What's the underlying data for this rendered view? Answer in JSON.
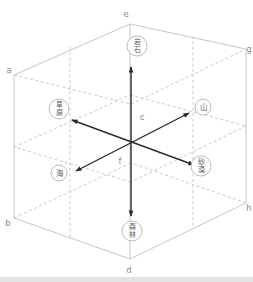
{
  "figure": {
    "width": 253,
    "height": 282,
    "colors": {
      "background": "#ffffff",
      "cube_line": "#c6c6c6",
      "dashed_line": "#c9c9c9",
      "arrow": "#2b2b2b",
      "vertex_label": "#8a8a8a",
      "node_ring": "#b4b4b4",
      "node_fill": "#ffffff",
      "node_text": "#5a5a5a",
      "bottom_strip": "#e3e3e3"
    },
    "solid_lines": [
      [
        14,
        75,
        130,
        24
      ],
      [
        130,
        24,
        246,
        49
      ],
      [
        246,
        49,
        246,
        203
      ],
      [
        246,
        203,
        130,
        259
      ],
      [
        130,
        259,
        14,
        218
      ],
      [
        14,
        218,
        14,
        75
      ],
      [
        130,
        24,
        130,
        259
      ]
    ],
    "dashed_lines": [
      [
        14,
        75,
        131,
        104
      ],
      [
        131,
        104,
        246,
        49
      ],
      [
        14,
        218,
        131,
        163
      ],
      [
        246,
        203,
        131,
        163
      ],
      [
        14,
        147,
        130,
        95
      ],
      [
        130,
        95,
        246,
        126
      ],
      [
        246,
        126,
        131,
        182
      ],
      [
        131,
        182,
        14,
        147
      ],
      [
        70,
        47,
        70,
        240
      ],
      [
        193,
        36,
        193,
        227
      ]
    ],
    "arrows": [
      {
        "name": "axis-vertical",
        "x1": 131,
        "y1": 67,
        "x2": 131,
        "y2": 216
      },
      {
        "name": "axis-ne-sw",
        "x1": 189,
        "y1": 113,
        "x2": 76,
        "y2": 171
      },
      {
        "name": "axis-nw-se",
        "x1": 72,
        "y1": 120,
        "x2": 194,
        "y2": 165
      }
    ],
    "vertex_labels": [
      {
        "id": "e",
        "text": "e",
        "x": 126,
        "y": 17
      },
      {
        "id": "a",
        "text": "a",
        "x": 9,
        "y": 73
      },
      {
        "id": "g",
        "text": "g",
        "x": 249,
        "y": 52
      },
      {
        "id": "b",
        "text": "b",
        "x": 8,
        "y": 226
      },
      {
        "id": "h",
        "text": "h",
        "x": 249,
        "y": 211
      },
      {
        "id": "d",
        "text": "d",
        "x": 129,
        "y": 273
      },
      {
        "id": "c",
        "text": "c",
        "x": 142,
        "y": 120
      },
      {
        "id": "f",
        "text": "f",
        "x": 120,
        "y": 164
      }
    ],
    "word_nodes": [
      {
        "id": "top",
        "text": "岩石",
        "x": 137,
        "y": 46,
        "r": 10
      },
      {
        "id": "left-upper",
        "text": "草原",
        "x": 59,
        "y": 109,
        "r": 10
      },
      {
        "id": "right-upper",
        "text": "山",
        "x": 203,
        "y": 107,
        "r": 8
      },
      {
        "id": "left-lower",
        "text": "海",
        "x": 59,
        "y": 173,
        "r": 8
      },
      {
        "id": "right-lower",
        "text": "砂漠",
        "x": 201,
        "y": 166,
        "r": 10
      },
      {
        "id": "bottom",
        "text": "森林",
        "x": 132,
        "y": 231,
        "r": 10
      }
    ]
  }
}
